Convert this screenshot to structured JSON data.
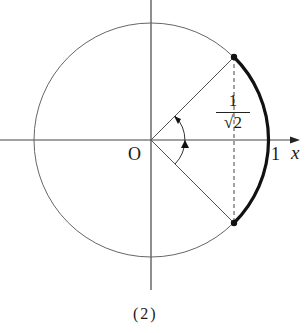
{
  "figure": {
    "caption": "(2)",
    "origin_label": "O",
    "x_axis_label": "x",
    "unit_label": "1",
    "fraction": {
      "numerator": "1",
      "denominator_radical": "√",
      "denominator_value": "2"
    }
  },
  "colors": {
    "line": "#555555",
    "arc": "#111111",
    "text": "#1a1a1a"
  }
}
